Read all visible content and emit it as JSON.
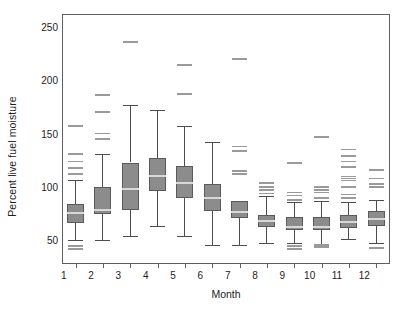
{
  "chart_data": {
    "type": "box",
    "title": "",
    "xlabel": "Month",
    "ylabel": "Percent live fuel moisture",
    "categories": [
      "1",
      "2",
      "3",
      "4",
      "5",
      "6",
      "7",
      "8",
      "9",
      "10",
      "11",
      "12"
    ],
    "ytick_labels": [
      "50",
      "100",
      "150",
      "200",
      "250"
    ],
    "ytick_values": [
      50,
      100,
      150,
      200,
      250
    ],
    "ylim": [
      28,
      262
    ],
    "grid": false,
    "legend": "none",
    "box_fill_color": "#8c8c8c",
    "box_edge_color": "#5a5a5a",
    "median_color": "#d8d8d8",
    "whisker_color": "#4d4d4d",
    "outlier_color": "#9a9a9a",
    "frame_color": "#606060",
    "boxes": [
      {
        "category": "1",
        "whisker_low": 50,
        "q1": 66,
        "median": 76,
        "q3": 84,
        "whisker_high": 107,
        "outliers": [
          42,
          45,
          112,
          118,
          124,
          131,
          157
        ]
      },
      {
        "category": "2",
        "whisker_low": 50,
        "q1": 75,
        "median": 79,
        "q3": 100,
        "whisker_high": 131,
        "outliers": [
          145,
          150,
          170,
          186
        ]
      },
      {
        "category": "3",
        "whisker_low": 54,
        "q1": 79,
        "median": 98,
        "q3": 123,
        "whisker_high": 177,
        "outliers": [
          236
        ]
      },
      {
        "category": "4",
        "whisker_low": 64,
        "q1": 96,
        "median": 110,
        "q3": 127,
        "whisker_high": 172,
        "outliers": []
      },
      {
        "category": "5",
        "whisker_low": 54,
        "q1": 90,
        "median": 104,
        "q3": 120,
        "whisker_high": 157,
        "outliers": [
          187,
          214
        ]
      },
      {
        "category": "6",
        "whisker_low": 46,
        "q1": 78,
        "median": 90,
        "q3": 103,
        "whisker_high": 142,
        "outliers": []
      },
      {
        "category": "7",
        "whisker_low": 46,
        "q1": 71,
        "median": 77,
        "q3": 87,
        "whisker_high": 87,
        "outliers": [
          112,
          115,
          134,
          138,
          220
        ]
      },
      {
        "category": "8",
        "whisker_low": 48,
        "q1": 63,
        "median": 68,
        "q3": 74,
        "whisker_high": 92,
        "outliers": [
          94,
          97,
          100,
          104
        ]
      },
      {
        "category": "9",
        "whisker_low": 48,
        "q1": 60,
        "median": 63,
        "q3": 72,
        "whisker_high": 86,
        "outliers": [
          42,
          45,
          88,
          92,
          95,
          122,
          123
        ]
      },
      {
        "category": "10",
        "whisker_low": 45,
        "q1": 60,
        "median": 63,
        "q3": 72,
        "whisker_high": 87,
        "outliers": [
          44,
          46,
          90,
          95,
          97,
          100,
          147
        ]
      },
      {
        "category": "11",
        "whisker_low": 51,
        "q1": 62,
        "median": 67,
        "q3": 74,
        "whisker_high": 86,
        "outliers": [
          90,
          93,
          100,
          106,
          108,
          110,
          119,
          124,
          129,
          135
        ]
      },
      {
        "category": "12",
        "whisker_low": 48,
        "q1": 64,
        "median": 70,
        "q3": 78,
        "whisker_high": 88,
        "outliers": [
          43,
          100,
          103,
          108,
          116
        ]
      }
    ]
  }
}
